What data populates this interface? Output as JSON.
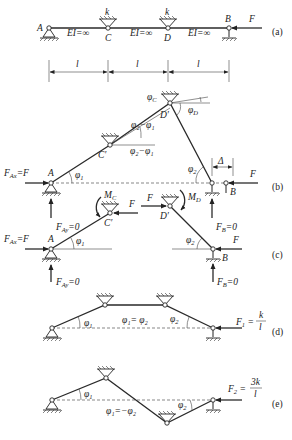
{
  "figure": {
    "panels": [
      "(a)",
      "(b)",
      "(c)",
      "(d)",
      "(e)"
    ]
  },
  "panel_a": {
    "label": "(a)",
    "nodes": {
      "A": "A",
      "C": "C",
      "D": "D",
      "B": "B"
    },
    "spring_labels": [
      "k",
      "k"
    ],
    "stiffness_labels": [
      "EI=∞",
      "EI=∞",
      "EI=∞"
    ],
    "force": "F",
    "spans": [
      "l",
      "l",
      "l"
    ]
  },
  "panel_b": {
    "label": "(b)",
    "nodes": {
      "A": "A",
      "C": "C′",
      "D": "D′",
      "B": "B"
    },
    "reactions": {
      "FAx": "F",
      "FAx_lhs": "F",
      "FAx_sub": "Ax",
      "FAy_sub": "Ay",
      "FAy_val": "=0",
      "FB_sub": "B",
      "FB_val": "=0"
    },
    "angles": {
      "phi1": "φ",
      "phi1_sub": "1",
      "phi2": "φ",
      "phi2_sub": "2",
      "phiC": "φ",
      "phiC_sub": "C",
      "phiD": "φ",
      "phiD_sub": "D",
      "diff1": "φ₂−φ₁",
      "diff2": "φ₂−φ₁"
    },
    "delta": "Δ",
    "force": "F"
  },
  "panel_c": {
    "label": "(c)",
    "nodes": {
      "A": "A",
      "C": "C′",
      "D": "D′",
      "B": "B"
    },
    "moments": {
      "MC": "M",
      "MC_sub": "C",
      "MD": "M",
      "MD_sub": "D"
    },
    "forces": [
      "F",
      "F",
      "F"
    ],
    "reactions": {
      "FAx_sub": "Ax",
      "FAy_sub": "Ay",
      "FAy_val": "=0",
      "FB_sub": "B",
      "FB_val": "=0"
    },
    "angles": {
      "phi1_sub": "1",
      "phi2_sub": "2"
    }
  },
  "panel_d": {
    "label": "(d)",
    "angles": {
      "phi1_sub": "1",
      "phi2_sub": "2",
      "relation": "φ₁= φ₂"
    },
    "force": {
      "name": "F",
      "sub": "1",
      "num": "k",
      "den": "l"
    }
  },
  "panel_e": {
    "label": "(e)",
    "angles": {
      "phi1_sub": "1",
      "phi2_sub": "2",
      "relation": "φ₁=−φ₂"
    },
    "force": {
      "name": "F",
      "sub": "2",
      "num": "3k",
      "den": "l"
    }
  }
}
